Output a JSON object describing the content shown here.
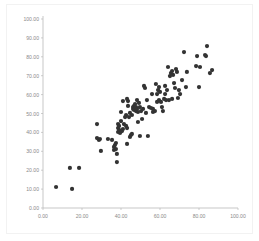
{
  "chart_data": {
    "type": "scatter",
    "title": "",
    "subtitle": "",
    "xlabel": "",
    "ylabel": "",
    "xlim": [
      0,
      100
    ],
    "ylim": [
      0,
      100
    ],
    "grid": false,
    "legend": null,
    "marker": {
      "shape": "circle",
      "color": "#333333",
      "size": 2.1
    },
    "axis": {
      "x_ticks": [
        0,
        20,
        40,
        60,
        80,
        100
      ],
      "x_tick_labels": [
        "0.00",
        "20.00",
        "40.00",
        "60.00",
        "80.00",
        "100.00"
      ],
      "y_ticks": [
        0,
        10,
        20,
        30,
        40,
        50,
        60,
        70,
        80,
        90,
        100
      ],
      "y_tick_labels": [
        "0.00",
        "10.00",
        "20.00",
        "30.00",
        "40.00",
        "50.00",
        "60.00",
        "70.00",
        "80.00",
        "90.00",
        "100.00"
      ],
      "axis_color": "#b9b9b9",
      "tick_label_color": "#8a8a8a"
    },
    "series": [
      {
        "name": "series-1",
        "points": [
          [
            6.7,
            11.1
          ],
          [
            14.9,
            10.1
          ],
          [
            13.8,
            21.2
          ],
          [
            18.5,
            21.2
          ],
          [
            27.7,
            37.0
          ],
          [
            28.7,
            36.0
          ],
          [
            29.2,
            36.5
          ],
          [
            27.7,
            44.4
          ],
          [
            29.7,
            30.2
          ],
          [
            33.3,
            36.5
          ],
          [
            35.4,
            36.0
          ],
          [
            36.4,
            30.7
          ],
          [
            36.4,
            32.3
          ],
          [
            36.9,
            33.3
          ],
          [
            37.4,
            31.2
          ],
          [
            37.4,
            34.4
          ],
          [
            37.9,
            24.3
          ],
          [
            37.9,
            28.6
          ],
          [
            38.5,
            40.2
          ],
          [
            38.5,
            42.3
          ],
          [
            38.5,
            44.4
          ],
          [
            39.0,
            41.3
          ],
          [
            39.0,
            43.4
          ],
          [
            39.5,
            39.7
          ],
          [
            40.0,
            46.0
          ],
          [
            40.5,
            40.7
          ],
          [
            41.0,
            41.8
          ],
          [
            41.5,
            44.4
          ],
          [
            42.1,
            48.1
          ],
          [
            42.6,
            49.2
          ],
          [
            42.6,
            43.4
          ],
          [
            43.1,
            42.3
          ],
          [
            43.1,
            33.9
          ],
          [
            43.6,
            54.0
          ],
          [
            43.6,
            56.6
          ],
          [
            44.1,
            48.1
          ],
          [
            44.6,
            50.3
          ],
          [
            44.6,
            37.6
          ],
          [
            45.1,
            38.6
          ],
          [
            45.6,
            39.2
          ],
          [
            45.6,
            49.2
          ],
          [
            46.2,
            52.4
          ],
          [
            46.2,
            53.4
          ],
          [
            46.7,
            51.9
          ],
          [
            46.7,
            54.0
          ],
          [
            47.2,
            52.9
          ],
          [
            47.2,
            55.0
          ],
          [
            47.7,
            51.3
          ],
          [
            47.7,
            53.4
          ],
          [
            48.2,
            52.4
          ],
          [
            48.2,
            57.1
          ],
          [
            48.7,
            45.5
          ],
          [
            48.7,
            50.8
          ],
          [
            49.2,
            55.6
          ],
          [
            49.7,
            53.4
          ],
          [
            49.7,
            38.1
          ],
          [
            50.3,
            51.3
          ],
          [
            50.8,
            47.1
          ],
          [
            51.3,
            52.4
          ],
          [
            51.8,
            64.6
          ],
          [
            52.3,
            63.5
          ],
          [
            52.8,
            50.3
          ],
          [
            53.3,
            57.1
          ],
          [
            53.8,
            38.1
          ],
          [
            43.1,
            57.7
          ],
          [
            41.0,
            56.6
          ],
          [
            40.0,
            50.8
          ],
          [
            54.4,
            53.4
          ],
          [
            55.4,
            52.9
          ],
          [
            55.9,
            60.3
          ],
          [
            56.4,
            52.4
          ],
          [
            56.4,
            50.8
          ],
          [
            57.4,
            51.3
          ],
          [
            57.9,
            65.6
          ],
          [
            58.5,
            56.1
          ],
          [
            58.5,
            60.3
          ],
          [
            59.0,
            62.4
          ],
          [
            59.5,
            57.1
          ],
          [
            59.5,
            64.0
          ],
          [
            60.0,
            61.4
          ],
          [
            60.5,
            56.1
          ],
          [
            61.0,
            53.4
          ],
          [
            61.5,
            51.3
          ],
          [
            62.1,
            57.7
          ],
          [
            62.6,
            60.3
          ],
          [
            62.6,
            64.6
          ],
          [
            63.1,
            57.1
          ],
          [
            63.6,
            62.4
          ],
          [
            64.1,
            74.6
          ],
          [
            64.6,
            57.1
          ],
          [
            65.1,
            69.8
          ],
          [
            65.6,
            71.4
          ],
          [
            66.2,
            72.5
          ],
          [
            66.2,
            57.7
          ],
          [
            66.7,
            70.4
          ],
          [
            67.2,
            66.1
          ],
          [
            67.7,
            63.5
          ],
          [
            68.2,
            73.5
          ],
          [
            68.7,
            72.0
          ],
          [
            69.2,
            58.2
          ],
          [
            69.7,
            62.4
          ],
          [
            70.3,
            60.3
          ],
          [
            71.3,
            67.7
          ],
          [
            72.3,
            82.5
          ],
          [
            73.3,
            64.0
          ],
          [
            73.8,
            72.0
          ],
          [
            78.5,
            75.1
          ],
          [
            79.0,
            80.4
          ],
          [
            80.0,
            64.0
          ],
          [
            80.5,
            74.6
          ],
          [
            83.1,
            80.9
          ],
          [
            83.6,
            80.4
          ],
          [
            84.1,
            85.7
          ],
          [
            85.6,
            71.4
          ],
          [
            86.7,
            73.0
          ]
        ]
      }
    ]
  }
}
